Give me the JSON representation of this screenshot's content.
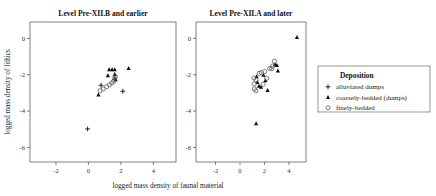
{
  "figure": {
    "xlabel": "logged mass density of faunal material",
    "ylabel": "logged mass density of lithics"
  },
  "legend": {
    "title": "Deposition",
    "entries": [
      {
        "label": "alluviated dumps",
        "marker": "plus-icon"
      },
      {
        "label": "coarsely-bedded (dumps)",
        "marker": "triangle-icon"
      },
      {
        "label": "finely-bedded",
        "marker": "circle-icon"
      }
    ]
  },
  "chart_data": {
    "type": "scatter",
    "title": "",
    "xlabel": "logged mass density of faunal material",
    "ylabel": "logged mass density of lithics",
    "xlim": [
      -3.6,
      5.4
    ],
    "ylim": [
      -6.8,
      0.9
    ],
    "xticks": [
      -2,
      0,
      2,
      4
    ],
    "yticks": [
      0,
      -2,
      -4,
      -6
    ],
    "xtick_labels": [
      "-2",
      "0",
      "2",
      "4"
    ],
    "ytick_labels": [
      "0",
      "-2",
      "-4",
      "-6"
    ],
    "grid": false,
    "legend_position": "right",
    "panels": [
      {
        "title": "Level Pre-XII.B and earlier",
        "series": [
          {
            "name": "alluviated dumps",
            "marker": "plus",
            "points": [
              {
                "x": -0.05,
                "y": -4.98
              },
              {
                "x": 0.78,
                "y": -2.58
              },
              {
                "x": 1.62,
                "y": -2.25
              },
              {
                "x": 2.12,
                "y": -2.91
              }
            ]
          },
          {
            "name": "coarsely-bedded (dumps)",
            "marker": "triangle",
            "points": [
              {
                "x": 0.62,
                "y": -3.1
              },
              {
                "x": 1.2,
                "y": -2.05
              },
              {
                "x": 1.28,
                "y": -1.72
              },
              {
                "x": 1.46,
                "y": -1.71
              },
              {
                "x": 1.62,
                "y": -1.72
              },
              {
                "x": 1.62,
                "y": -1.98
              },
              {
                "x": 1.68,
                "y": -2.26
              },
              {
                "x": 2.48,
                "y": -1.64
              }
            ]
          },
          {
            "name": "finely-bedded",
            "marker": "circle",
            "points": [
              {
                "x": 0.72,
                "y": -2.88
              },
              {
                "x": 0.92,
                "y": -2.78
              },
              {
                "x": 1.12,
                "y": -2.66
              },
              {
                "x": 1.3,
                "y": -2.56
              },
              {
                "x": 1.44,
                "y": -2.45
              },
              {
                "x": 1.56,
                "y": -2.36
              },
              {
                "x": 1.62,
                "y": -2.2
              },
              {
                "x": 1.66,
                "y": -2.1
              }
            ]
          }
        ]
      },
      {
        "title": "Level Pre-XII.A and later",
        "series": [
          {
            "name": "alluviated dumps",
            "marker": "plus",
            "points": []
          },
          {
            "name": "coarsely-bedded (dumps)",
            "marker": "triangle",
            "points": [
              {
                "x": 1.32,
                "y": -4.68
              },
              {
                "x": 1.36,
                "y": -2.1
              },
              {
                "x": 1.42,
                "y": -2.42
              },
              {
                "x": 1.55,
                "y": -2.62
              },
              {
                "x": 1.72,
                "y": -2.68
              },
              {
                "x": 1.92,
                "y": -2.02
              },
              {
                "x": 2.08,
                "y": -2.32
              },
              {
                "x": 2.26,
                "y": -2.86
              },
              {
                "x": 2.86,
                "y": -1.44
              },
              {
                "x": 3.02,
                "y": -1.48
              },
              {
                "x": 3.1,
                "y": -1.78
              },
              {
                "x": 4.66,
                "y": 0.06
              }
            ]
          },
          {
            "name": "finely-bedded",
            "marker": "circle",
            "points": [
              {
                "x": 1.14,
                "y": -2.18
              },
              {
                "x": 1.16,
                "y": -2.5
              },
              {
                "x": 1.18,
                "y": -2.78
              },
              {
                "x": 1.3,
                "y": -2.88
              },
              {
                "x": 1.32,
                "y": -2.28
              },
              {
                "x": 1.58,
                "y": -1.92
              },
              {
                "x": 1.74,
                "y": -1.88
              },
              {
                "x": 1.9,
                "y": -2.52
              },
              {
                "x": 2.02,
                "y": -1.82
              },
              {
                "x": 2.18,
                "y": -2.2
              },
              {
                "x": 2.44,
                "y": -1.66
              },
              {
                "x": 2.6,
                "y": -1.66
              },
              {
                "x": 2.66,
                "y": -1.52
              },
              {
                "x": 2.82,
                "y": -1.26
              }
            ]
          }
        ]
      }
    ]
  }
}
